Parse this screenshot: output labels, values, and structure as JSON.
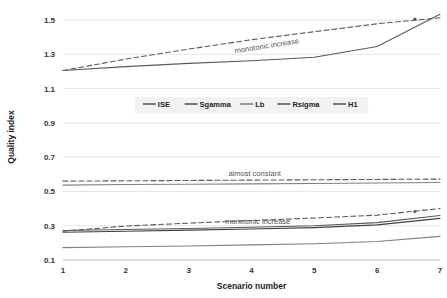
{
  "chart_data": {
    "type": "line",
    "title": "",
    "xlabel": "Scenario number",
    "ylabel": "Quality index",
    "x": [
      1,
      2,
      3,
      4,
      5,
      6,
      7
    ],
    "xticklabels": [
      "1",
      "2",
      "3",
      "4",
      "5",
      "6",
      "7"
    ],
    "yticklabels": [
      "0.1",
      "0.3",
      "0.5",
      "0.7",
      "0.9",
      "1.1",
      "1.3",
      "1.5"
    ],
    "yticks": [
      0.1,
      0.3,
      0.5,
      0.7,
      0.9,
      1.1,
      1.3,
      1.5
    ],
    "xlim": [
      1,
      7
    ],
    "ylim": [
      0.1,
      1.58
    ],
    "grid": true,
    "legend_position": "center",
    "series": [
      {
        "name": "ISE",
        "style": "solid",
        "color": "#595959",
        "values": [
          1.205,
          1.228,
          1.247,
          1.262,
          1.283,
          1.345,
          1.533
        ]
      },
      {
        "name": "Sgamma",
        "style": "dashed",
        "color": "#595959",
        "values": [
          1.205,
          1.272,
          1.33,
          1.385,
          1.432,
          1.478,
          1.513
        ]
      },
      {
        "name": "Lb",
        "style": "solid",
        "color": "#808080",
        "values": [
          0.537,
          0.54,
          0.542,
          0.544,
          0.546,
          0.549,
          0.552
        ]
      },
      {
        "name": "Rsigma",
        "style": "dashed",
        "color": "#595959",
        "values": [
          0.56,
          0.562,
          0.564,
          0.566,
          0.568,
          0.57,
          0.572
        ]
      },
      {
        "name": "H1",
        "style": "solid",
        "color": "#595959",
        "values": [
          0.272,
          0.278,
          0.284,
          0.291,
          0.3,
          0.318,
          0.36
        ]
      }
    ],
    "extra_series": [
      {
        "name": "lower-dashed",
        "style": "dashed",
        "color": "#595959",
        "values": [
          0.268,
          0.298,
          0.315,
          0.33,
          0.345,
          0.362,
          0.4
        ]
      },
      {
        "name": "lower-solid-mid",
        "style": "solid",
        "color": "#404040",
        "values": [
          0.262,
          0.268,
          0.274,
          0.281,
          0.289,
          0.305,
          0.343
        ]
      },
      {
        "name": "lower-solid-bottom",
        "style": "solid",
        "color": "#808080",
        "values": [
          0.172,
          0.177,
          0.182,
          0.188,
          0.195,
          0.208,
          0.238
        ]
      }
    ],
    "annotations": [
      {
        "text": "monotonic increase",
        "x": 4.25,
        "y": 1.335,
        "rotation": -9
      },
      {
        "text": "almost constant",
        "x": 4.05,
        "y": 0.592,
        "rotation": 0
      },
      {
        "text": "monotonic increase",
        "x": 4.1,
        "y": 0.31,
        "rotation": 0
      }
    ],
    "markers": [
      {
        "series": "Sgamma",
        "x": 6.6,
        "y": 1.505
      },
      {
        "series": "lower-dashed",
        "x": 6.6,
        "y": 0.383
      }
    ]
  },
  "legend": {
    "items": [
      {
        "label": "ISE"
      },
      {
        "label": "Sgamma"
      },
      {
        "label": "Lb"
      },
      {
        "label": "Rsigma"
      },
      {
        "label": "H1"
      }
    ]
  },
  "colors": {
    "grid": "#d9d9d9",
    "axis": "#bfbfbf",
    "text": "#333333",
    "annotation": "#555555",
    "line_dark": "#595959",
    "line_mid": "#404040",
    "line_light": "#808080",
    "legend_background": "#f2f2f2"
  }
}
